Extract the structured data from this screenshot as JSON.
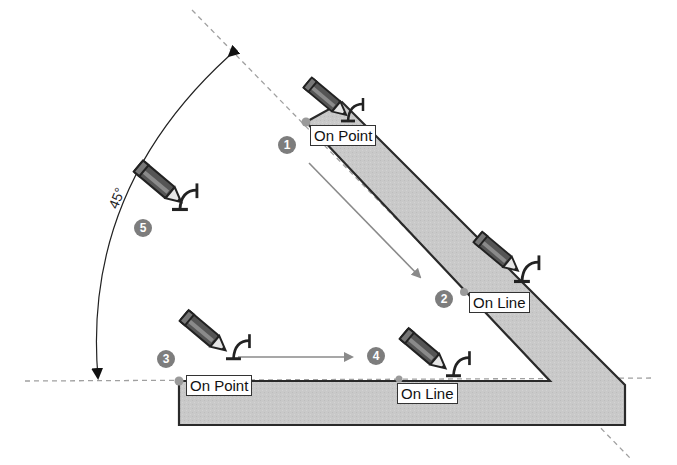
{
  "diagram": {
    "angle_label": "45°",
    "steps": [
      {
        "number": "1",
        "inference": "On Point"
      },
      {
        "number": "2",
        "inference": "On Line"
      },
      {
        "number": "3",
        "inference": "On Point"
      },
      {
        "number": "4",
        "inference": "On Line"
      },
      {
        "number": "5",
        "inference": ""
      }
    ],
    "icons": [
      "pencil-cursor-icon",
      "protractor-icon"
    ],
    "colors": {
      "shape_fill": "#c8c8c8",
      "shape_stroke": "#2a2a2a",
      "guide_line": "#999999",
      "arrow": "#888888",
      "badge": "#7d7d7d"
    }
  }
}
